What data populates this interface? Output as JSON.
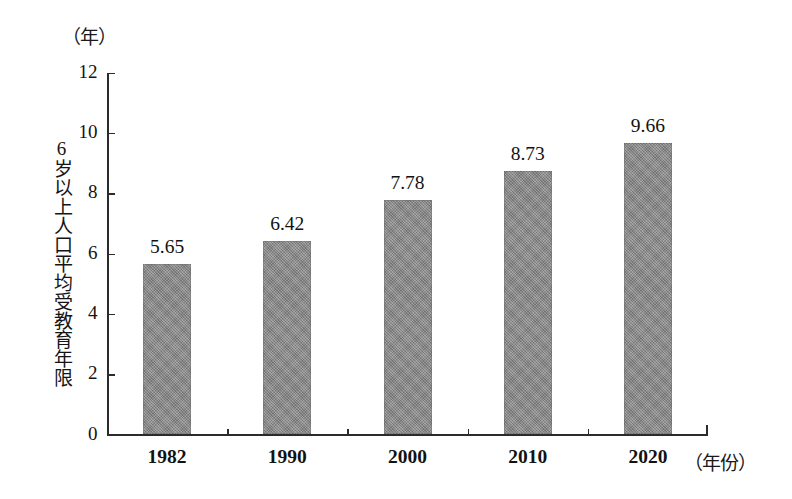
{
  "chart_data": {
    "type": "bar",
    "title": "",
    "xlabel": "（年份）",
    "ylabel": "6岁以上人口平均受教育年限",
    "yunit": "（年）",
    "categories": [
      "1982",
      "1990",
      "2000",
      "2010",
      "2020"
    ],
    "values": [
      5.65,
      6.42,
      7.78,
      8.73,
      9.66
    ],
    "value_labels": [
      "5.65",
      "6.42",
      "7.78",
      "8.73",
      "9.66"
    ],
    "ylim": [
      0,
      12
    ],
    "yticks": [
      0,
      2,
      4,
      6,
      8,
      10,
      12
    ],
    "ytick_labels": [
      "0",
      "2",
      "4",
      "6",
      "8",
      "10",
      "12"
    ],
    "grid": false,
    "legend": false,
    "bar_color": "#8b8b8b",
    "axis_color": "#2b2b2b",
    "background": "#ffffff"
  }
}
